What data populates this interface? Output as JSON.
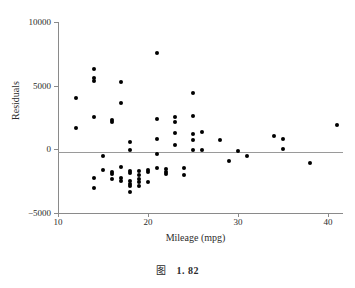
{
  "figure": {
    "caption_symbol": "图",
    "caption_number": "1. 82"
  },
  "chart_data": {
    "type": "scatter",
    "title": "",
    "xlabel": "Mileage (mpg)",
    "ylabel": "Residuals",
    "xlim": [
      10,
      41.7
    ],
    "ylim": [
      -5000,
      10000
    ],
    "xticks": [
      10,
      20,
      30,
      40
    ],
    "xtick_labels": [
      "10",
      "20",
      "30",
      "40"
    ],
    "yticks": [
      -5000,
      0,
      5000,
      10000
    ],
    "ytick_labels": [
      "-5000",
      "0",
      "5000",
      "10000"
    ],
    "grid": false,
    "legend": null,
    "reference_lines": [
      {
        "orientation": "horizontal",
        "value": 0,
        "color": "#9a9a9a"
      }
    ],
    "marker": {
      "shape": "circle",
      "color": "#000000",
      "size": 4
    },
    "points": [
      {
        "x": 12.0,
        "y": 4000
      },
      {
        "x": 12.0,
        "y": 1700
      },
      {
        "x": 14.0,
        "y": 6300
      },
      {
        "x": 14.0,
        "y": 5600
      },
      {
        "x": 14.0,
        "y": 5350
      },
      {
        "x": 14.0,
        "y": 2550
      },
      {
        "x": 14.0,
        "y": -2250
      },
      {
        "x": 14.0,
        "y": -3050
      },
      {
        "x": 15.0,
        "y": -550
      },
      {
        "x": 15.0,
        "y": -1600
      },
      {
        "x": 16.0,
        "y": 2300
      },
      {
        "x": 16.0,
        "y": 2150
      },
      {
        "x": 16.0,
        "y": -1800
      },
      {
        "x": 16.0,
        "y": -1950
      },
      {
        "x": 16.0,
        "y": -2300
      },
      {
        "x": 17.0,
        "y": 5300
      },
      {
        "x": 17.0,
        "y": 3600
      },
      {
        "x": 17.0,
        "y": -1350
      },
      {
        "x": 17.0,
        "y": -2250
      },
      {
        "x": 17.0,
        "y": -2450
      },
      {
        "x": 18.0,
        "y": 550
      },
      {
        "x": 18.0,
        "y": -50
      },
      {
        "x": 18.0,
        "y": -1700
      },
      {
        "x": 18.0,
        "y": -1850
      },
      {
        "x": 18.0,
        "y": -2450
      },
      {
        "x": 18.0,
        "y": -2700
      },
      {
        "x": 18.0,
        "y": -2900
      },
      {
        "x": 18.0,
        "y": -3350
      },
      {
        "x": 19.0,
        "y": -1700
      },
      {
        "x": 19.0,
        "y": -2000
      },
      {
        "x": 19.0,
        "y": -2350
      },
      {
        "x": 19.0,
        "y": -2600
      },
      {
        "x": 19.0,
        "y": -2900
      },
      {
        "x": 20.0,
        "y": -1600
      },
      {
        "x": 20.0,
        "y": -1750
      },
      {
        "x": 20.0,
        "y": -2600
      },
      {
        "x": 21.0,
        "y": 7550
      },
      {
        "x": 21.0,
        "y": 2350
      },
      {
        "x": 21.0,
        "y": 800
      },
      {
        "x": 21.0,
        "y": -400
      },
      {
        "x": 21.0,
        "y": -1450
      },
      {
        "x": 22.0,
        "y": -1550
      },
      {
        "x": 22.0,
        "y": -1800
      },
      {
        "x": 22.0,
        "y": -1950
      },
      {
        "x": 23.0,
        "y": 2550
      },
      {
        "x": 23.0,
        "y": 2150
      },
      {
        "x": 23.0,
        "y": 1250
      },
      {
        "x": 23.0,
        "y": 350
      },
      {
        "x": 24.0,
        "y": -1450
      },
      {
        "x": 24.0,
        "y": -2000
      },
      {
        "x": 25.0,
        "y": 4400
      },
      {
        "x": 25.0,
        "y": 2600
      },
      {
        "x": 25.0,
        "y": 1200
      },
      {
        "x": 25.0,
        "y": 700
      },
      {
        "x": 25.0,
        "y": -50
      },
      {
        "x": 26.0,
        "y": 1400
      },
      {
        "x": 26.0,
        "y": -50
      },
      {
        "x": 28.0,
        "y": 700
      },
      {
        "x": 29.0,
        "y": -900
      },
      {
        "x": 30.0,
        "y": -150
      },
      {
        "x": 31.0,
        "y": -500
      },
      {
        "x": 34.0,
        "y": 1050
      },
      {
        "x": 35.0,
        "y": 850
      },
      {
        "x": 35.0,
        "y": 0
      },
      {
        "x": 38.0,
        "y": -1050
      },
      {
        "x": 41.0,
        "y": 1950
      }
    ]
  }
}
